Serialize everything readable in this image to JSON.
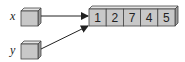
{
  "diagram": {
    "variables": [
      {
        "name": "x"
      },
      {
        "name": "y"
      }
    ],
    "array": {
      "values": [
        "1",
        "2",
        "7",
        "4",
        "5"
      ]
    },
    "colors": {
      "box_fill": "#c8c8c8",
      "box_top": "#e4e4e4",
      "box_side": "#9a9a9a",
      "stroke": "#333333"
    }
  }
}
